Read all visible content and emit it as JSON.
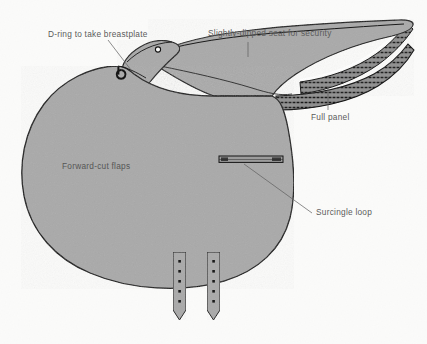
{
  "figure": {
    "view": "side elevation, pommel at left, cantle at right",
    "background_color": "#fbfbfa",
    "leather_fill_color": "#a9a9a9",
    "outline_color": "#1b1b1b",
    "label_text_color": "#5b5b5b",
    "leader_line_color": "#5d5d5d"
  },
  "labels": [
    {
      "id": "d-ring",
      "text": "D-ring to take breastplate",
      "text_x": 48,
      "text_y": 37,
      "leader": "diagonal",
      "points_to": "small D-ring at front of pommel / flap junction"
    },
    {
      "id": "seat",
      "text": "Slightly-dipped seat for security",
      "text_x": 208,
      "text_y": 36,
      "leader": "vertical",
      "points_to": "dipped seat curve"
    },
    {
      "id": "panel",
      "text": "Full panel",
      "text_x": 311,
      "text_y": 120,
      "leader": "vertical",
      "points_to": "stitched full panel beneath cantle"
    },
    {
      "id": "surcingle",
      "text": "Surcingle loop",
      "text_x": 316,
      "text_y": 215,
      "leader": "diagonal",
      "points_to": "horizontal surcingle loop strap on flap"
    },
    {
      "id": "flaps",
      "text": "Forward-cut flaps",
      "text_x": 62,
      "text_y": 169,
      "leader": "none",
      "points_to": "large forward-cut saddle flap (label sits on the flap)"
    }
  ],
  "parts": [
    {
      "name": "pommel",
      "description": "raised front arch with small stud circle"
    },
    {
      "name": "seat",
      "description": "slightly dipped seat sweeping back to cantle"
    },
    {
      "name": "cantle",
      "description": "upswept rear of seat"
    },
    {
      "name": "full-panel",
      "description": "layered stitched panel under the seat, extending to cantle tip"
    },
    {
      "name": "forward-cut-flap",
      "description": "large rounded flap cut forward for jumping position"
    },
    {
      "name": "surcingle-loop",
      "description": "horizontal strap loop across lower flap"
    },
    {
      "name": "billet-straps",
      "description": "two girth billet straps with punched holes",
      "count": 2,
      "holes_per_strap": 6
    },
    {
      "name": "d-ring",
      "description": "small D-ring at pommel front for breastplate attachment"
    }
  ]
}
